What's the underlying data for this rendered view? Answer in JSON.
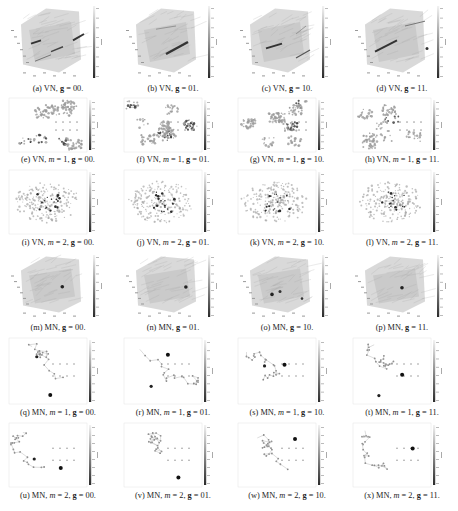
{
  "figure": {
    "subfigures": [
      {
        "id": "a",
        "label": "(a)",
        "net": "VN",
        "m": null,
        "g": "00",
        "kind": "cube3d",
        "streaks": "two-diag"
      },
      {
        "id": "b",
        "label": "(b)",
        "net": "VN",
        "m": null,
        "g": "01",
        "kind": "cube3d",
        "streaks": "center-diag"
      },
      {
        "id": "c",
        "label": "(c)",
        "net": "VN",
        "m": null,
        "g": "10",
        "kind": "cube3d",
        "streaks": "mid-left"
      },
      {
        "id": "d",
        "label": "(d)",
        "net": "VN",
        "m": null,
        "g": "11",
        "kind": "cube3d",
        "streaks": "left-diag"
      },
      {
        "id": "e",
        "label": "(e)",
        "net": "VN",
        "m": "1",
        "g": "00",
        "kind": "clusters2d"
      },
      {
        "id": "f",
        "label": "(f)",
        "net": "VN",
        "m": "1",
        "g": "01",
        "kind": "clusters2d"
      },
      {
        "id": "g",
        "label": "(g)",
        "net": "VN",
        "m": "1",
        "g": "10",
        "kind": "clusters2d"
      },
      {
        "id": "h",
        "label": "(h)",
        "net": "VN",
        "m": "1",
        "g": "11",
        "kind": "clusters2d"
      },
      {
        "id": "i",
        "label": "(i)",
        "net": "VN",
        "m": "2",
        "g": "00",
        "kind": "blob2d"
      },
      {
        "id": "j",
        "label": "(j)",
        "net": "VN",
        "m": "2",
        "g": "01",
        "kind": "blob2d"
      },
      {
        "id": "k",
        "label": "(k)",
        "net": "VN",
        "m": "2",
        "g": "10",
        "kind": "blob2d"
      },
      {
        "id": "l",
        "label": "(l)",
        "net": "VN",
        "m": "2",
        "g": "11",
        "kind": "blob2d"
      },
      {
        "id": "m",
        "label": "(m)",
        "net": "MN",
        "m": null,
        "g": "00",
        "kind": "cube3d",
        "streaks": "dot"
      },
      {
        "id": "n",
        "label": "(n)",
        "net": "MN",
        "m": null,
        "g": "01",
        "kind": "cube3d",
        "streaks": "dot"
      },
      {
        "id": "o",
        "label": "(o)",
        "net": "MN",
        "m": null,
        "g": "10",
        "kind": "cube3d",
        "streaks": "dots"
      },
      {
        "id": "p",
        "label": "(p)",
        "net": "MN",
        "m": null,
        "g": "11",
        "kind": "cube3d",
        "streaks": "dot"
      },
      {
        "id": "q",
        "label": "(q)",
        "net": "MN",
        "m": "1",
        "g": "00",
        "kind": "graph2d"
      },
      {
        "id": "r",
        "label": "(r)",
        "net": "MN",
        "m": "1",
        "g": "01",
        "kind": "graph2d"
      },
      {
        "id": "s",
        "label": "(s)",
        "net": "MN",
        "m": "1",
        "g": "10",
        "kind": "graph2d"
      },
      {
        "id": "t",
        "label": "(t)",
        "net": "MN",
        "m": "1",
        "g": "11",
        "kind": "graph2d"
      },
      {
        "id": "u",
        "label": "(u)",
        "net": "MN",
        "m": "2",
        "g": "00",
        "kind": "graph2d"
      },
      {
        "id": "v",
        "label": "(v)",
        "net": "MN",
        "m": "2",
        "g": "01",
        "kind": "graph2d"
      },
      {
        "id": "w",
        "label": "(w)",
        "net": "MN",
        "m": "2",
        "g": "10",
        "kind": "graph2d"
      },
      {
        "id": "x",
        "label": "(x)",
        "net": "MN",
        "m": "2",
        "g": "11",
        "kind": "graph2d"
      }
    ],
    "caption_parts": {
      "m_symbol": "m",
      "g_symbol": "g",
      "equals": " = ",
      "separator": ", ",
      "terminator": "."
    },
    "colorbar": {
      "gradient_top": "#f2f2f2",
      "gradient_bottom": "#2a2a2a"
    },
    "colors": {
      "background": "#ffffff",
      "cloud": "#c8c8c8",
      "dark": "#2a2a2a",
      "text": "#222222"
    }
  }
}
